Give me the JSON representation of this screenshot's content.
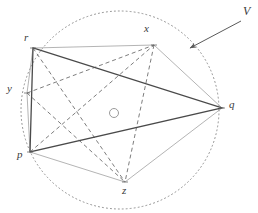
{
  "figure": {
    "canvas": {
      "width": 258,
      "height": 213,
      "background": "#ffffff"
    },
    "colors": {
      "circle_dotted": "#8f8f8f",
      "solid_triangle": "#4a4a4a",
      "hexagon_light": "#a8a8a8",
      "dashed": "#6e6e6e",
      "label_text": "#3a3a3a",
      "arrow": "#5a5a5a",
      "center_marker": "#9a9a9a"
    },
    "circumcircle": {
      "cx": 120,
      "cy": 110,
      "r": 99,
      "style": "dotted"
    },
    "center_marker": {
      "cx": 114,
      "cy": 113,
      "r": 4.5,
      "style": "solid-thin"
    },
    "vertices": [
      {
        "id": "p",
        "label": "p",
        "x": 30,
        "y": 152,
        "label_x": 17,
        "label_y": 155
      },
      {
        "id": "y",
        "label": "y",
        "x": 27,
        "y": 93,
        "label_x": 7,
        "label_y": 88
      },
      {
        "id": "r",
        "label": "r",
        "x": 33,
        "y": 48,
        "label_x": 24,
        "label_y": 37
      },
      {
        "id": "x",
        "label": "x",
        "x": 154,
        "y": 45,
        "label_x": 144,
        "label_y": 28
      },
      {
        "id": "q",
        "label": "q",
        "x": 222,
        "y": 108,
        "label_x": 229,
        "label_y": 104
      },
      {
        "id": "z",
        "label": "z",
        "x": 125,
        "y": 182,
        "label_x": 122,
        "label_y": 187
      }
    ],
    "solid_triangle": {
      "label": "p-r-q",
      "points": [
        "p",
        "r",
        "q"
      ]
    },
    "hexagon": {
      "label": "p-y-r-x-q-z",
      "points": [
        "p",
        "y",
        "r",
        "x",
        "q",
        "z"
      ]
    },
    "dashed_chords": [
      {
        "from": "y",
        "to": "x"
      },
      {
        "from": "x",
        "to": "z"
      },
      {
        "from": "r",
        "to": "z"
      },
      {
        "from": "p",
        "to": "x"
      },
      {
        "from": "y",
        "to": "z"
      }
    ],
    "annotation": {
      "label": "V",
      "label_x": 243,
      "label_y": 10,
      "arrow": {
        "x1": 241,
        "y1": 21,
        "x2": 190,
        "y2": 48
      }
    }
  }
}
